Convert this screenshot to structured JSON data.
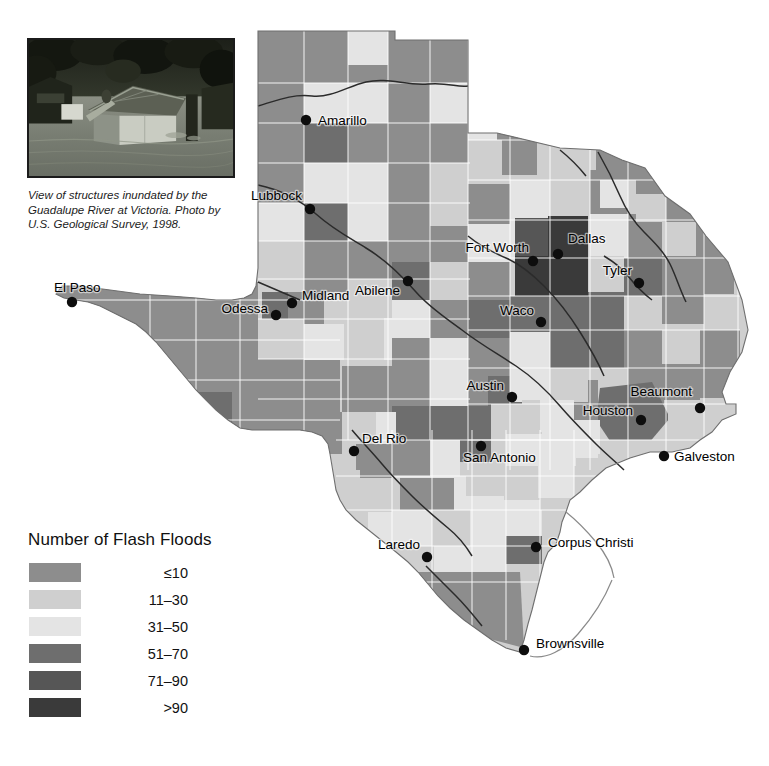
{
  "figure": {
    "kind": "choropleth-map",
    "region": "Texas",
    "background_color": "#ffffff"
  },
  "photo": {
    "name": "flood-photo",
    "caption": "View of structures inundated by the Guadalupe River at Victoria. Photo by U.S. Geological Survey, 1998.",
    "caption_lines": [
      "View of structures inundated by the",
      "Guadalupe River at Victoria. Photo by",
      "U.S. Geological Survey, 1998."
    ],
    "border_color": "#1b1b1b"
  },
  "legend": {
    "title": "Number of Flash Floods",
    "items": [
      {
        "label": "≤10",
        "color": "#8d8d8d"
      },
      {
        "label": "11–30",
        "color": "#cfcfcf"
      },
      {
        "label": "31–50",
        "color": "#e4e4e4"
      },
      {
        "label": "51–70",
        "color": "#6e6e6e"
      },
      {
        "label": "71–90",
        "color": "#565656"
      },
      {
        "label": ">90",
        "color": "#3a3a3a"
      }
    ]
  },
  "chart_data": {
    "type": "map",
    "title": "Number of Flash Floods",
    "classes": [
      "≤10",
      "11–30",
      "31–50",
      "51–70",
      "71–90",
      ">90"
    ],
    "class_colors": [
      "#8d8d8d",
      "#cfcfcf",
      "#e4e4e4",
      "#6e6e6e",
      "#565656",
      "#3a3a3a"
    ],
    "cities": [
      {
        "name": "Amarillo",
        "dot_x": 306,
        "dot_y": 120,
        "label_x": 318,
        "label_y": 125,
        "anchor": "start"
      },
      {
        "name": "Lubbock",
        "dot_x": 310,
        "dot_y": 209,
        "label_x": 302,
        "label_y": 200,
        "anchor": "end"
      },
      {
        "name": "El Paso",
        "dot_x": 72,
        "dot_y": 302,
        "label_x": 54,
        "label_y": 292,
        "anchor": "start"
      },
      {
        "name": "Odessa",
        "dot_x": 276,
        "dot_y": 315,
        "label_x": 268,
        "label_y": 313,
        "anchor": "end"
      },
      {
        "name": "Midland",
        "dot_x": 292,
        "dot_y": 303,
        "label_x": 302,
        "label_y": 300,
        "anchor": "start"
      },
      {
        "name": "Abilene",
        "dot_x": 408,
        "dot_y": 281,
        "label_x": 400,
        "label_y": 295,
        "anchor": "end"
      },
      {
        "name": "Fort Worth",
        "dot_x": 533,
        "dot_y": 261,
        "label_x": 529,
        "label_y": 252,
        "anchor": "end"
      },
      {
        "name": "Dallas",
        "dot_x": 558,
        "dot_y": 254,
        "label_x": 568,
        "label_y": 243,
        "anchor": "start"
      },
      {
        "name": "Tyler",
        "dot_x": 639,
        "dot_y": 283,
        "label_x": 632,
        "label_y": 275,
        "anchor": "end"
      },
      {
        "name": "Waco",
        "dot_x": 541,
        "dot_y": 322,
        "label_x": 534,
        "label_y": 315,
        "anchor": "end"
      },
      {
        "name": "Austin",
        "dot_x": 512,
        "dot_y": 397,
        "label_x": 504,
        "label_y": 390,
        "anchor": "end"
      },
      {
        "name": "Houston",
        "dot_x": 641,
        "dot_y": 420,
        "label_x": 633,
        "label_y": 415,
        "anchor": "end"
      },
      {
        "name": "Beaumont",
        "dot_x": 700,
        "dot_y": 408,
        "label_x": 692,
        "label_y": 396,
        "anchor": "end"
      },
      {
        "name": "Galveston",
        "dot_x": 664,
        "dot_y": 456,
        "label_x": 674,
        "label_y": 461,
        "anchor": "start"
      },
      {
        "name": "Del Rio",
        "dot_x": 354,
        "dot_y": 451,
        "label_x": 362,
        "label_y": 443,
        "anchor": "start"
      },
      {
        "name": "San Antonio",
        "dot_x": 481,
        "dot_y": 446,
        "label_x": 463,
        "label_y": 462,
        "anchor": "start"
      },
      {
        "name": "Laredo",
        "dot_x": 427,
        "dot_y": 557,
        "label_x": 420,
        "label_y": 549,
        "anchor": "end"
      },
      {
        "name": "Corpus Christi",
        "dot_x": 536,
        "dot_y": 547,
        "label_x": 548,
        "label_y": 547,
        "anchor": "start"
      },
      {
        "name": "Brownsville",
        "dot_x": 524,
        "dot_y": 650,
        "label_x": 536,
        "label_y": 648,
        "anchor": "start"
      }
    ]
  }
}
